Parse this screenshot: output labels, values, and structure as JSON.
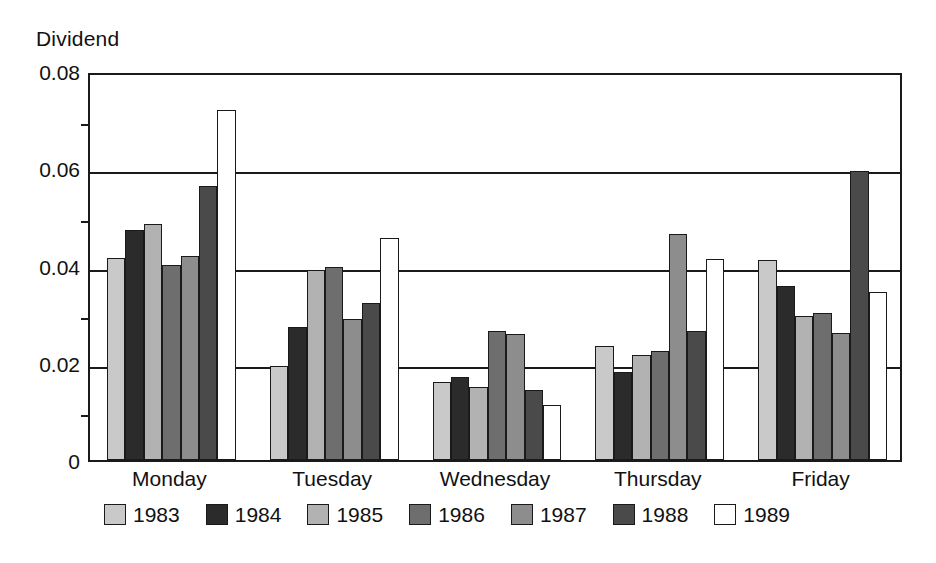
{
  "chart_data": {
    "type": "bar",
    "title": "",
    "ylabel": "Dividend",
    "xlabel": "",
    "ylim": [
      0,
      0.08
    ],
    "ytick_labels": [
      "0.08",
      "0.06",
      "0.04",
      "0.02",
      "0"
    ],
    "ytick_values": [
      0.08,
      0.06,
      0.04,
      0.02,
      0
    ],
    "minor_tick_values": [
      0.07,
      0.05,
      0.03,
      0.01
    ],
    "grid": true,
    "legend_position": "below-plot",
    "categories": [
      "Monday",
      "Tuesday",
      "Wednesday",
      "Thursday",
      "Friday"
    ],
    "series": [
      {
        "name": "1983",
        "color": "#c9c9c9",
        "values": [
          0.0415,
          0.0194,
          0.0161,
          0.0234,
          0.0411
        ]
      },
      {
        "name": "1984",
        "color": "#2b2b2b",
        "values": [
          0.0473,
          0.0273,
          0.0171,
          0.0181,
          0.0357
        ]
      },
      {
        "name": "1985",
        "color": "#b2b2b2",
        "values": [
          0.0486,
          0.039,
          0.015,
          0.0215,
          0.0297
        ]
      },
      {
        "name": "1986",
        "color": "#6e6e6e",
        "values": [
          0.0401,
          0.0396,
          0.0266,
          0.0224,
          0.0303
        ]
      },
      {
        "name": "1987",
        "color": "#8d8d8d",
        "values": [
          0.0419,
          0.029,
          0.0259,
          0.0464,
          0.0262
        ]
      },
      {
        "name": "1988",
        "color": "#4a4a4a",
        "values": [
          0.0563,
          0.0323,
          0.0145,
          0.0266,
          0.0595
        ]
      },
      {
        "name": "1989",
        "color": "#ffffff",
        "values": [
          0.072,
          0.0456,
          0.0113,
          0.0414,
          0.0345
        ]
      }
    ]
  },
  "legend": {
    "items": [
      {
        "label": "1983"
      },
      {
        "label": "1984"
      },
      {
        "label": "1985"
      },
      {
        "label": "1986"
      },
      {
        "label": "1987"
      },
      {
        "label": "1988"
      },
      {
        "label": "1989"
      }
    ]
  },
  "colors": {
    "axis": "#1a1a1a",
    "background": "#ffffff",
    "text": "#111111"
  }
}
